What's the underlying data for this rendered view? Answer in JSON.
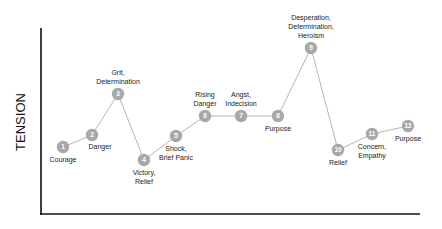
{
  "chart_data": {
    "type": "line",
    "title": "",
    "xlabel": "",
    "ylabel": "TENSION",
    "grid": false,
    "legend": null,
    "axes": {
      "x_axis": {
        "x1": 41,
        "x2": 420,
        "y": 214
      },
      "y_axis": {
        "x": 41,
        "y1": 28,
        "y2": 214
      }
    },
    "line_color": "#b5b5b5",
    "node_color": "#a8a8a8",
    "points": [
      {
        "n": "1",
        "x": 63,
        "y": 147,
        "label": [
          "Courage"
        ],
        "label_pos": "below"
      },
      {
        "n": "2",
        "x": 92,
        "y": 135,
        "label": [
          "Danger"
        ],
        "label_pos": "below-right"
      },
      {
        "n": "3",
        "x": 118,
        "y": 94,
        "label": [
          "Grit,",
          "Determination"
        ],
        "label_pos": "above"
      },
      {
        "n": "4",
        "x": 144,
        "y": 160,
        "label": [
          "Victory,",
          "Relief"
        ],
        "label_pos": "below"
      },
      {
        "n": "5",
        "x": 176,
        "y": 136,
        "label": [
          "Shock,",
          "Brief Panic"
        ],
        "label_pos": "below"
      },
      {
        "n": "6",
        "x": 205,
        "y": 116,
        "label": [
          "Rising",
          "Danger"
        ],
        "label_pos": "above"
      },
      {
        "n": "7",
        "x": 241,
        "y": 116,
        "label": [
          "Angst,",
          "Indecision"
        ],
        "label_pos": "above"
      },
      {
        "n": "8",
        "x": 278,
        "y": 116,
        "label": [
          "Purpose"
        ],
        "label_pos": "below"
      },
      {
        "n": "9",
        "x": 311,
        "y": 48,
        "label": [
          "Desperation,",
          "Determination,",
          "Heroism"
        ],
        "label_pos": "above"
      },
      {
        "n": "10",
        "x": 338,
        "y": 150,
        "label": [
          "Relief"
        ],
        "label_pos": "below"
      },
      {
        "n": "11",
        "x": 372,
        "y": 134,
        "label": [
          "Concern,",
          "Empathy"
        ],
        "label_pos": "below"
      },
      {
        "n": "12",
        "x": 408,
        "y": 126,
        "label": [
          "Purpose"
        ],
        "label_pos": "below"
      }
    ]
  }
}
